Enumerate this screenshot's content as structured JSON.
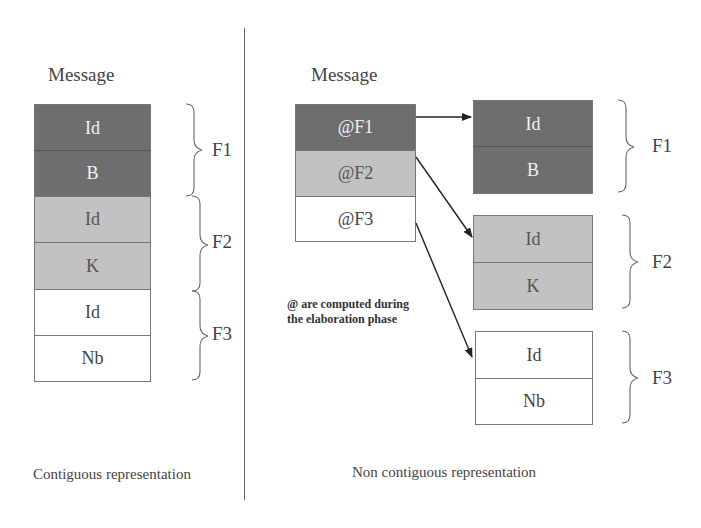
{
  "left": {
    "title": "Message",
    "cells": [
      {
        "label": "Id",
        "group": "F1"
      },
      {
        "label": "B",
        "group": "F1"
      },
      {
        "label": "Id",
        "group": "F2"
      },
      {
        "label": "K",
        "group": "F2"
      },
      {
        "label": "Id",
        "group": "F3"
      },
      {
        "label": "Nb",
        "group": "F3"
      }
    ],
    "groups": [
      "F1",
      "F2",
      "F3"
    ],
    "caption": "Contiguous representation"
  },
  "right": {
    "title": "Message",
    "pointers": [
      "@F1",
      "@F2",
      "@F3"
    ],
    "fragments": [
      {
        "name": "F1",
        "cells": [
          "Id",
          "B"
        ]
      },
      {
        "name": "F2",
        "cells": [
          "Id",
          "K"
        ]
      },
      {
        "name": "F3",
        "cells": [
          "Id",
          "Nb"
        ]
      }
    ],
    "note_line1": "@ are computed during",
    "note_line2": "the elaboration phase",
    "caption": "Non contiguous representation"
  },
  "colors": {
    "dark_fill": "#6e6e6e",
    "light_fill": "#c2c2c2",
    "white_fill": "#ffffff",
    "line": "#555555"
  }
}
